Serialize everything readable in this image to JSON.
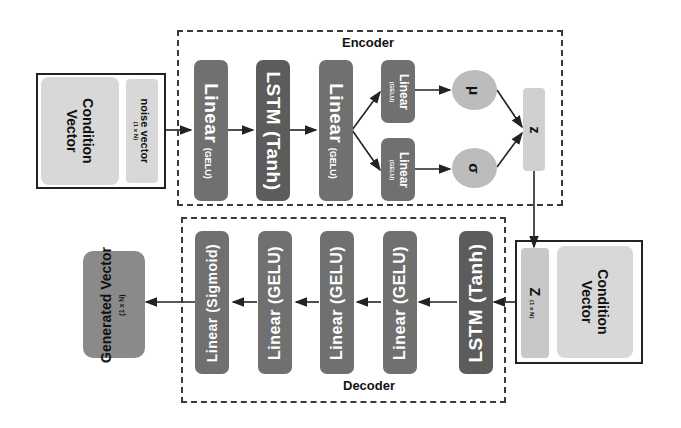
{
  "encoder": {
    "title": "Encoder",
    "input": {
      "condition_label": "Condition Vector",
      "noise_label": "noise vector",
      "noise_dims": "(1 x N)"
    },
    "layers": [
      {
        "name": "Linear",
        "activation": "(GELU)"
      },
      {
        "name": "LSTM (Tanh)",
        "activation": ""
      },
      {
        "name": "Linear",
        "activation": "(GELU)"
      }
    ],
    "branches": [
      {
        "name": "Linear",
        "activation": "(GELU)",
        "output": "μ"
      },
      {
        "name": "Linear",
        "activation": "(GELU)",
        "output": "σ"
      }
    ],
    "latent": "z"
  },
  "decoder": {
    "title": "Decoder",
    "input": {
      "z_label": "Z",
      "z_dims": "(1 x N)",
      "condition_label": "Condition Vector"
    },
    "layers": [
      {
        "label": "LSTM (Tanh)"
      },
      {
        "label": "Linear (GELU)"
      },
      {
        "label": "Linear (GELU)"
      },
      {
        "label": "Linear (GELU)"
      },
      {
        "label": "Linear (Sigmoid)"
      }
    ],
    "output": {
      "label": "Generated Vector",
      "dims": "(1 x N)"
    }
  },
  "colors": {
    "dark_block": "#707070",
    "lstm_block": "#5c5c5c",
    "light_block": "#d8d8d8",
    "circle": "#bcbcbc",
    "output_block": "#8a8a8a"
  }
}
